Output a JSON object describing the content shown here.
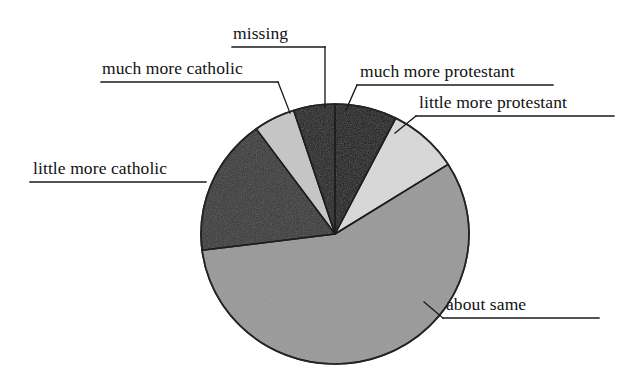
{
  "chart_data": {
    "type": "pie",
    "title": "",
    "categories": [
      "much more protestant",
      "little more protestant",
      "about same",
      "little more catholic",
      "much more catholic",
      "missing"
    ],
    "values": [
      7.5,
      8.5,
      57,
      17,
      5,
      5
    ],
    "units": "percent",
    "labels_placement": "external with leader lines and underlines",
    "legend": "none",
    "grid": false,
    "start_angle_deg": 0,
    "direction": "clockwise",
    "slice_colors": [
      "#0d0d0d",
      "#d9d9d9",
      "#989898",
      "#343434",
      "#c6c6c6",
      "#151515"
    ],
    "slices": [
      {
        "label": "much more protestant",
        "value": 7.5,
        "color": "#0d0d0d",
        "start_deg": 0,
        "end_deg": 27
      },
      {
        "label": "little more protestant",
        "value": 8.5,
        "color": "#d9d9d9",
        "start_deg": 27,
        "end_deg": 57.6
      },
      {
        "label": "about same",
        "value": 57,
        "color": "#989898",
        "start_deg": 57.6,
        "end_deg": 262.8
      },
      {
        "label": "little more catholic",
        "value": 17,
        "color": "#343434",
        "start_deg": 262.8,
        "end_deg": 324
      },
      {
        "label": "much more catholic",
        "value": 5,
        "color": "#c6c6c6",
        "start_deg": 324,
        "end_deg": 342
      },
      {
        "label": "missing",
        "value": 5,
        "color": "#151515",
        "start_deg": 342,
        "end_deg": 360
      }
    ]
  },
  "labels": {
    "missing": "missing",
    "much_more_catholic": "much more catholic",
    "much_more_protestant": "much more protestant",
    "little_more_protestant": "little more protestant",
    "little_more_catholic": "little more catholic",
    "about_same": "about same"
  },
  "colors": {
    "ink": "#111111",
    "background": "#ffffff",
    "outline": "#202020"
  }
}
